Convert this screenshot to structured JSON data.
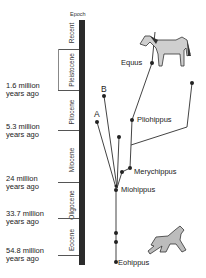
{
  "diagram": {
    "type": "phylogenetic-tree",
    "timescale_header": "Epoch",
    "epochs": [
      {
        "name": "Recent"
      },
      {
        "name": "Pleistocene"
      },
      {
        "name": "Pliocene"
      },
      {
        "name": "Miocene"
      },
      {
        "name": "Oligocene"
      },
      {
        "name": "Eocene"
      }
    ],
    "ages": [
      {
        "line1": "1.6 million",
        "line2": "years ago"
      },
      {
        "line1": "5.3 million",
        "line2": "years ago"
      },
      {
        "line1": "24 million",
        "line2": "years ago"
      },
      {
        "line1": "33.7 million",
        "line2": "years ago"
      },
      {
        "line1": "54.8 million",
        "line2": "years ago"
      }
    ],
    "species": {
      "equus": "Equus",
      "pliohippus": "Pliohippus",
      "merychippus": "Merychippus",
      "miohippus": "Miohippus",
      "eohippus": "Eohippus"
    },
    "branch_labels": {
      "a": "A",
      "b": "B"
    },
    "illustrations": [
      "modern-horse-icon",
      "eohippus-horse-icon"
    ]
  }
}
